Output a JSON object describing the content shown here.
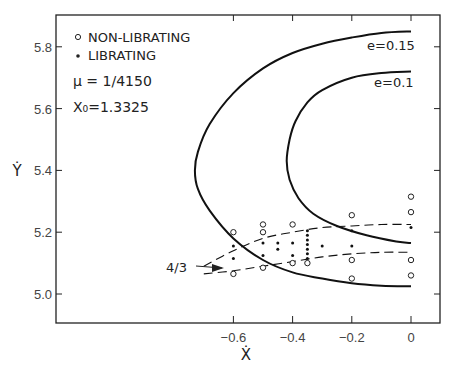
{
  "chart_data": {
    "type": "scatter",
    "title": "",
    "xlabel": "Ẋ",
    "ylabel": "Ẏ",
    "xlim": [
      -0.8,
      0.1
    ],
    "ylim": [
      4.92,
      5.92
    ],
    "x_ticks": [
      -0.6,
      -0.4,
      -0.2,
      0
    ],
    "x_tick_labels": [
      "-0.6",
      "-0.4",
      "-0.2",
      "0"
    ],
    "y_ticks": [
      5.0,
      5.2,
      5.4,
      5.6,
      5.8
    ],
    "y_tick_labels": [
      "5.0",
      "5.2",
      "5.4",
      "5.6",
      "5.8"
    ],
    "grid": false,
    "legend": {
      "position": "upper-left",
      "entries": [
        {
          "marker": "open-circle",
          "label": "NON-LIBRATING"
        },
        {
          "marker": "filled-dot",
          "label": "LIBRATING"
        }
      ]
    },
    "parameters": {
      "mu_label": "μ = 1/4150",
      "x0_label": "X₀=1.3325"
    },
    "curves": [
      {
        "name": "e=0.15",
        "style": "solid",
        "x": [
          0.0,
          -0.1,
          -0.2,
          -0.3,
          -0.4,
          -0.5,
          -0.6,
          -0.68,
          -0.72,
          -0.73,
          -0.72,
          -0.68,
          -0.6,
          -0.5,
          -0.4,
          -0.3,
          -0.2,
          -0.1,
          0.0
        ],
        "y": [
          5.85,
          5.845,
          5.83,
          5.81,
          5.78,
          5.73,
          5.65,
          5.55,
          5.46,
          5.4,
          5.34,
          5.27,
          5.18,
          5.11,
          5.07,
          5.05,
          5.035,
          5.027,
          5.025
        ]
      },
      {
        "name": "e=0.1",
        "style": "solid",
        "x": [
          0.0,
          -0.1,
          -0.2,
          -0.3,
          -0.35,
          -0.39,
          -0.41,
          -0.42,
          -0.41,
          -0.38,
          -0.33,
          -0.25,
          -0.15,
          -0.05,
          0.0
        ],
        "y": [
          5.72,
          5.715,
          5.7,
          5.66,
          5.62,
          5.56,
          5.5,
          5.43,
          5.37,
          5.31,
          5.26,
          5.22,
          5.19,
          5.17,
          5.165
        ]
      },
      {
        "name": "4/3 upper",
        "style": "dashed",
        "x": [
          -0.7,
          -0.6,
          -0.5,
          -0.4,
          -0.3,
          -0.2,
          -0.1,
          0.0
        ],
        "y": [
          5.09,
          5.14,
          5.18,
          5.2,
          5.215,
          5.22,
          5.225,
          5.225
        ]
      },
      {
        "name": "4/3 lower",
        "style": "dashed",
        "x": [
          -0.7,
          -0.6,
          -0.5,
          -0.4,
          -0.3,
          -0.2,
          -0.1,
          0.0
        ],
        "y": [
          5.065,
          5.075,
          5.09,
          5.105,
          5.12,
          5.13,
          5.135,
          5.135
        ]
      }
    ],
    "series": [
      {
        "name": "NON-LIBRATING",
        "marker": "open-circle",
        "points": [
          [
            -0.6,
            5.2
          ],
          [
            -0.6,
            5.065
          ],
          [
            -0.5,
            5.225
          ],
          [
            -0.5,
            5.2
          ],
          [
            -0.5,
            5.085
          ],
          [
            -0.4,
            5.225
          ],
          [
            -0.4,
            5.1
          ],
          [
            -0.35,
            5.1
          ],
          [
            -0.2,
            5.255
          ],
          [
            -0.2,
            5.11
          ],
          [
            -0.2,
            5.05
          ],
          [
            0.0,
            5.315
          ],
          [
            0.0,
            5.265
          ],
          [
            0.0,
            5.11
          ],
          [
            0.0,
            5.06
          ]
        ]
      },
      {
        "name": "LIBRATING",
        "marker": "filled-dot",
        "points": [
          [
            -0.6,
            5.155
          ],
          [
            -0.6,
            5.115
          ],
          [
            -0.5,
            5.165
          ],
          [
            -0.5,
            5.125
          ],
          [
            -0.45,
            5.165
          ],
          [
            -0.45,
            5.145
          ],
          [
            -0.4,
            5.165
          ],
          [
            -0.4,
            5.125
          ],
          [
            -0.35,
            5.205
          ],
          [
            -0.35,
            5.19
          ],
          [
            -0.35,
            5.175
          ],
          [
            -0.35,
            5.16
          ],
          [
            -0.35,
            5.145
          ],
          [
            -0.35,
            5.13
          ],
          [
            -0.35,
            5.115
          ],
          [
            -0.3,
            5.155
          ],
          [
            -0.2,
            5.205
          ],
          [
            -0.2,
            5.155
          ],
          [
            0.0,
            5.215
          ]
        ]
      }
    ],
    "annotations": [
      {
        "text": "e=0.15",
        "x": -0.04,
        "y": 5.775
      },
      {
        "text": "e=0.1",
        "x": -0.04,
        "y": 5.705
      },
      {
        "text": "4/3",
        "x": -0.78,
        "y": 5.085,
        "arrow_to": [
          -0.67,
          5.075
        ]
      }
    ]
  }
}
